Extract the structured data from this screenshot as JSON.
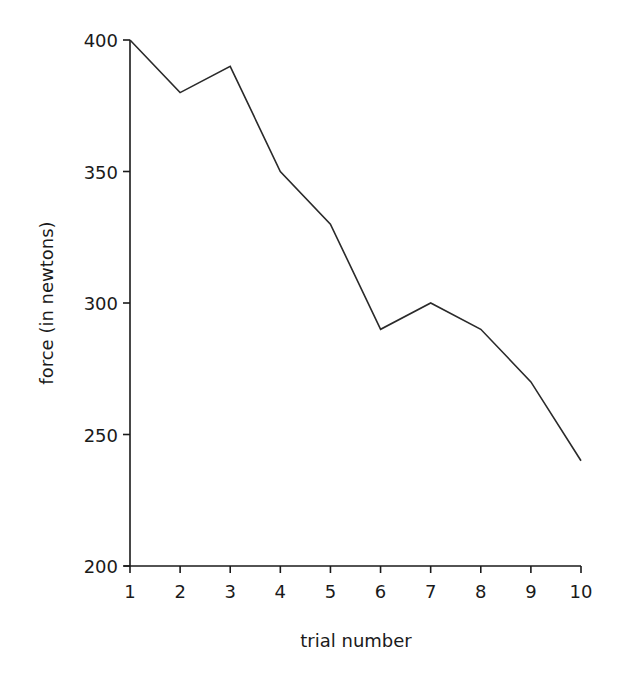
{
  "chart_data": {
    "type": "line",
    "title": "",
    "xlabel": "trial number",
    "ylabel": "force (in newtons)",
    "x": [
      1,
      2,
      3,
      4,
      5,
      6,
      7,
      8,
      9,
      10
    ],
    "categories": [
      "1",
      "2",
      "3",
      "4",
      "5",
      "6",
      "7",
      "8",
      "9",
      "10"
    ],
    "series": [
      {
        "name": "force",
        "values": [
          400,
          380,
          390,
          350,
          330,
          290,
          300,
          290,
          270,
          240
        ]
      }
    ],
    "xlim": [
      1,
      10
    ],
    "ylim": [
      200,
      400
    ],
    "yticks": [
      200,
      250,
      300,
      350,
      400
    ],
    "xticks": [
      1,
      2,
      3,
      4,
      5,
      6,
      7,
      8,
      9,
      10
    ],
    "grid": false,
    "legend": null,
    "line_color": "#2a2a2a"
  }
}
